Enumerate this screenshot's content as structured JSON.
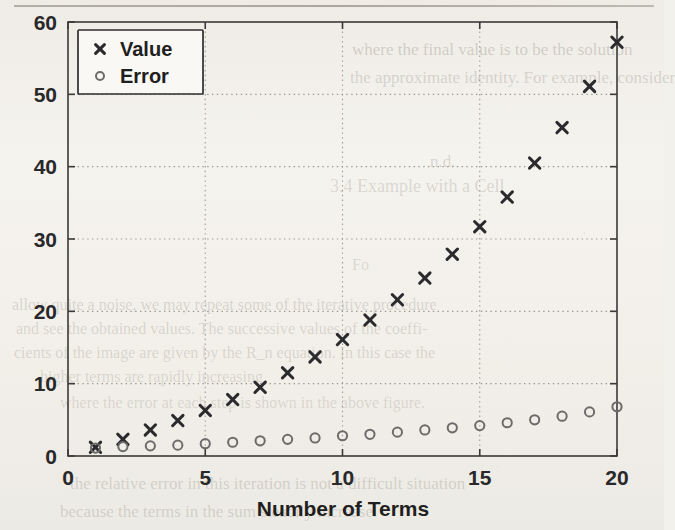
{
  "chart_data": {
    "type": "scatter",
    "title": "",
    "xlabel": "Number of Terms",
    "ylabel": "",
    "xlim": [
      0,
      20
    ],
    "ylim": [
      0,
      60
    ],
    "xticks": [
      "0",
      "5",
      "10",
      "15",
      "20"
    ],
    "yticks": [
      "0",
      "10",
      "20",
      "30",
      "40",
      "50",
      "60"
    ],
    "grid": true,
    "legend_position": "upper-left",
    "x": [
      1,
      2,
      3,
      4,
      5,
      6,
      7,
      8,
      9,
      10,
      11,
      12,
      13,
      14,
      15,
      16,
      17,
      18,
      19,
      20
    ],
    "series": [
      {
        "name": "Value",
        "marker": "x",
        "color": "#2b2a2c",
        "values": [
          1.2,
          2.3,
          3.6,
          4.9,
          6.3,
          7.8,
          9.5,
          11.5,
          13.7,
          16.1,
          18.8,
          21.6,
          24.6,
          27.9,
          31.7,
          35.8,
          40.5,
          45.4,
          51.1,
          57.2
        ]
      },
      {
        "name": "Error",
        "marker": "o",
        "color": "#6d6b69",
        "values": [
          1.1,
          1.3,
          1.4,
          1.5,
          1.7,
          1.9,
          2.1,
          2.3,
          2.5,
          2.8,
          3.0,
          3.3,
          3.6,
          3.9,
          4.2,
          4.6,
          5.0,
          5.5,
          6.1,
          6.8
        ]
      }
    ]
  },
  "legend": {
    "entries": [
      {
        "label": "Value",
        "marker_icon": "cross-marker-icon"
      },
      {
        "label": "Error",
        "marker_icon": "circle-marker-icon"
      }
    ]
  },
  "background_text": {
    "lines": [
      {
        "text": "where the final value is to be the solution",
        "x": 352,
        "y": 40,
        "size": 17,
        "op": 0.3
      },
      {
        "text": "the approximate identity. For example, consider",
        "x": 350,
        "y": 68,
        "size": 17,
        "op": 0.27
      },
      {
        "text": "n.d.",
        "x": 430,
        "y": 152,
        "size": 17,
        "op": 0.26
      },
      {
        "text": "3.4  Example with a Cell",
        "x": 330,
        "y": 176,
        "size": 18,
        "op": 0.24
      },
      {
        "text": "Fo",
        "x": 352,
        "y": 256,
        "size": 16,
        "op": 0.22
      },
      {
        "text": "allow quite a noise, we may repeat some of the iterative procedure",
        "x": 12,
        "y": 296,
        "size": 16,
        "op": 0.25
      },
      {
        "text": "and see the obtained values. The successive values of the coeffi-",
        "x": 16,
        "y": 320,
        "size": 16,
        "op": 0.24
      },
      {
        "text": "cients of the image are given by the R_n equation. In this case the",
        "x": 14,
        "y": 344,
        "size": 16,
        "op": 0.24
      },
      {
        "text": "higher terms are rapidly increasing.",
        "x": 40,
        "y": 368,
        "size": 16,
        "op": 0.23
      },
      {
        "text": "where the error at each step is shown in the above figure.",
        "x": 60,
        "y": 394,
        "size": 16,
        "op": 0.22
      },
      {
        "text": "the relative error in this iteration is not a difficult situation",
        "x": 70,
        "y": 474,
        "size": 17,
        "op": 0.26
      },
      {
        "text": "because the terms in the sum steadily increase.",
        "x": 60,
        "y": 502,
        "size": 17,
        "op": 0.26
      }
    ]
  }
}
